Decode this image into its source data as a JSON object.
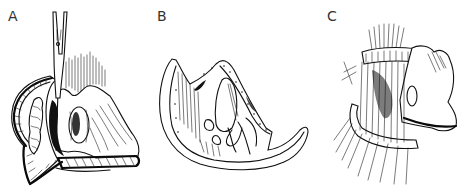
{
  "figure": {
    "panels": [
      {
        "id": "A",
        "label": "A",
        "description": "Scissors instrument inserted vertically; curved hatched flap on left with textured mass; tissue mass with oval opening on right; fine vertical lines above"
      },
      {
        "id": "B",
        "label": "B",
        "description": "Crescent-shaped tissue viewed from above with central oval structure, dotted margin and curving threads"
      },
      {
        "id": "C",
        "label": "C",
        "description": "Tissue block with multiple sutures placed through a curved band, strands radiating upward and fanning downward"
      }
    ],
    "colors": {
      "ink": "#111111",
      "background": "#ffffff",
      "label": "#333333"
    }
  }
}
